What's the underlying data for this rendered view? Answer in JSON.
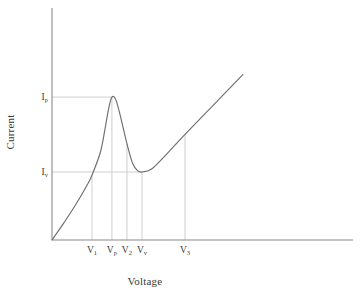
{
  "chart_data": {
    "type": "line",
    "title": "",
    "xlabel": "Voltage",
    "ylabel": "Current",
    "grid": false,
    "legend": null,
    "xlim": [
      0,
      1
    ],
    "ylim": [
      0,
      1
    ],
    "axis_ticks_numeric": false,
    "x_tick_labels": [
      "V1",
      "Vp",
      "V2",
      "Vv",
      "V3"
    ],
    "x_tick_label_base": [
      "V",
      "V",
      "V",
      "V",
      "V"
    ],
    "x_tick_label_sub": [
      "1",
      "p",
      "2",
      "v",
      "3"
    ],
    "x_tick_positions": [
      0.133,
      0.199,
      0.249,
      0.299,
      0.442
    ],
    "y_tick_labels": [
      "Ip",
      "Iv"
    ],
    "y_tick_label_base": [
      "I",
      "I"
    ],
    "y_tick_label_sub": [
      "p",
      "v"
    ],
    "y_tick_positions": [
      0.616,
      0.293
    ],
    "series": [
      {
        "name": "I-V characteristic",
        "points": [
          {
            "x": 0.0,
            "y": 0.0
          },
          {
            "x": 0.04,
            "y": 0.075
          },
          {
            "x": 0.08,
            "y": 0.155
          },
          {
            "x": 0.12,
            "y": 0.245
          },
          {
            "x": 0.133,
            "y": 0.28
          },
          {
            "x": 0.16,
            "y": 0.375
          },
          {
            "x": 0.175,
            "y": 0.47
          },
          {
            "x": 0.188,
            "y": 0.565
          },
          {
            "x": 0.199,
            "y": 0.616
          },
          {
            "x": 0.212,
            "y": 0.605
          },
          {
            "x": 0.228,
            "y": 0.53
          },
          {
            "x": 0.249,
            "y": 0.415
          },
          {
            "x": 0.268,
            "y": 0.33
          },
          {
            "x": 0.285,
            "y": 0.298
          },
          {
            "x": 0.299,
            "y": 0.293
          },
          {
            "x": 0.33,
            "y": 0.305
          },
          {
            "x": 0.37,
            "y": 0.355
          },
          {
            "x": 0.442,
            "y": 0.455
          },
          {
            "x": 0.55,
            "y": 0.6
          },
          {
            "x": 0.634,
            "y": 0.713
          }
        ]
      }
    ],
    "annotations": {
      "peak_marker": {
        "label": "Peak point",
        "x_label": "Vp",
        "y_label": "Ip"
      },
      "valley_marker": {
        "label": "Valley point",
        "x_label": "Vv",
        "y_label": "Iv"
      },
      "guide_lines_vertical": [
        "V1",
        "Vp",
        "V2",
        "Vv",
        "V3"
      ],
      "guide_lines_horizontal": [
        "Ip",
        "Iv"
      ]
    },
    "colors": {
      "curve": "#6e6e6e",
      "axis": "#8a8a8a",
      "guide": "#c9c9c9",
      "text": "#3a3a3a",
      "background": "#ffffff"
    }
  }
}
